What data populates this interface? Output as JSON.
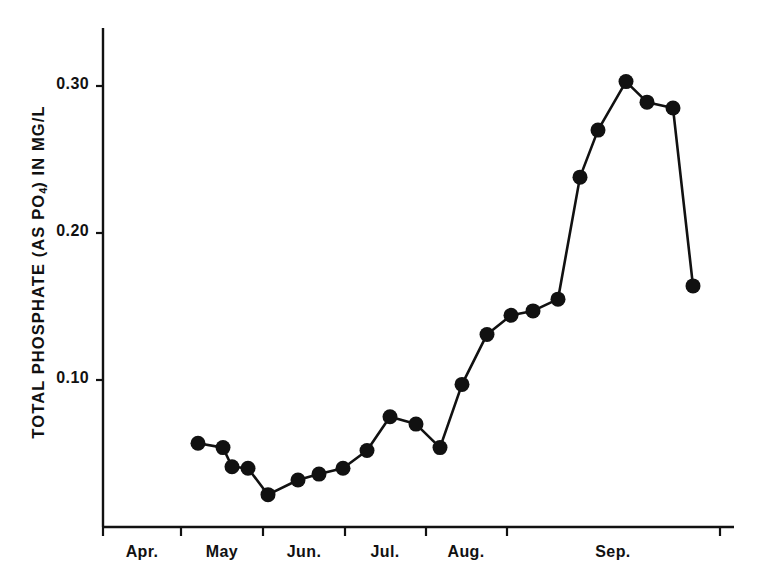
{
  "chart_data": {
    "type": "line",
    "title": "",
    "subtitle": "",
    "xlabel": "",
    "ylabel": "TOTAL PHOSPHATE (AS PO4) IN MG/L",
    "ylabel_parts": {
      "before": "TOTAL  PHOSPHATE (AS  PO",
      "sub": "4",
      "after": ") IN  MG/L"
    },
    "ylim": [
      0.0,
      0.345
    ],
    "xlim": [
      0,
      26.5
    ],
    "grid": false,
    "legend": null,
    "marker": "filled-circle",
    "y_ticks": [
      {
        "value": 0.3,
        "label": "0.30"
      },
      {
        "value": 0.2,
        "label": "0.20"
      },
      {
        "value": 0.1,
        "label": "0.10"
      }
    ],
    "x_ticks": [
      {
        "x": 0.0,
        "label": ""
      },
      {
        "x": 3.1,
        "label": ""
      },
      {
        "x": 6.4,
        "label": ""
      },
      {
        "x": 9.7,
        "label": ""
      },
      {
        "x": 12.9,
        "label": ""
      },
      {
        "x": 16.1,
        "label": ""
      },
      {
        "x": 24.6,
        "label": ""
      }
    ],
    "x_tick_pixels": [
      103,
      181,
      263,
      345,
      426,
      507,
      720
    ],
    "x_category_labels": [
      {
        "label": "Apr.",
        "pixel": 142
      },
      {
        "label": "May",
        "pixel": 222
      },
      {
        "label": "Jun.",
        "pixel": 304
      },
      {
        "label": "Jul.",
        "pixel": 385
      },
      {
        "label": "Aug.",
        "pixel": 466
      },
      {
        "label": "Sep.",
        "pixel": 613
      }
    ],
    "points": [
      {
        "px": 198,
        "value": 0.057
      },
      {
        "px": 223,
        "value": 0.054
      },
      {
        "px": 232,
        "value": 0.041
      },
      {
        "px": 248,
        "value": 0.04
      },
      {
        "px": 268,
        "value": 0.022
      },
      {
        "px": 298,
        "value": 0.032
      },
      {
        "px": 319,
        "value": 0.036
      },
      {
        "px": 343,
        "value": 0.04
      },
      {
        "px": 367,
        "value": 0.052
      },
      {
        "px": 390,
        "value": 0.075
      },
      {
        "px": 416,
        "value": 0.07
      },
      {
        "px": 440,
        "value": 0.054
      },
      {
        "px": 462,
        "value": 0.097
      },
      {
        "px": 487,
        "value": 0.131
      },
      {
        "px": 511,
        "value": 0.144
      },
      {
        "px": 533,
        "value": 0.147
      },
      {
        "px": 558,
        "value": 0.155
      },
      {
        "px": 580,
        "value": 0.238
      },
      {
        "px": 598,
        "value": 0.27
      },
      {
        "px": 626,
        "value": 0.303
      },
      {
        "px": 647,
        "value": 0.289
      },
      {
        "px": 673,
        "value": 0.285
      },
      {
        "px": 693,
        "value": 0.164
      }
    ],
    "values": [
      0.057,
      0.054,
      0.041,
      0.04,
      0.022,
      0.032,
      0.036,
      0.04,
      0.052,
      0.075,
      0.07,
      0.054,
      0.097,
      0.131,
      0.144,
      0.147,
      0.155,
      0.238,
      0.27,
      0.303,
      0.289,
      0.285,
      0.164
    ],
    "colors": {
      "line": "#111111",
      "marker": "#111111",
      "axis": "#111111",
      "background": "#ffffff"
    },
    "geometry": {
      "axis_x": 103,
      "axis_top": 28,
      "axis_bottom": 527,
      "axis_right": 734,
      "y_zero_pixel": 527,
      "pixels_per_0_10": 147,
      "marker_radius": 7.5,
      "line_width": 2.6
    }
  }
}
